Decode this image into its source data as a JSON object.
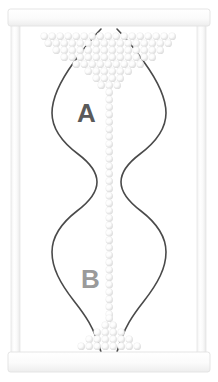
{
  "figure": {
    "background_color": "#ffffff"
  },
  "frame": {
    "top_bar": {
      "name": "top-rail-bar",
      "x": 8,
      "y": 9,
      "width": 202,
      "height": 17,
      "fill": "#fbfbfb",
      "stroke": "#e2e2e2"
    },
    "bottom_bar": {
      "name": "bottom-rail-bar",
      "x": 8,
      "y": 352,
      "width": 202,
      "height": 20,
      "fill": "#fbfbfb",
      "stroke": "#e2e2e2"
    },
    "left_rail": {
      "name": "left-vertical-rail",
      "x": 11,
      "y": 25,
      "width": 9,
      "height": 329,
      "fill": "#fcfcfc",
      "stroke": "#e6e6e6"
    },
    "right_rail": {
      "name": "right-vertical-rail",
      "x": 197,
      "y": 25,
      "width": 9,
      "height": 329,
      "fill": "#fcfcfc",
      "stroke": "#e6e6e6"
    }
  },
  "chamber_outline": {
    "stroke_color": "#4a4a4a",
    "stroke_width": 1.6,
    "fill": "#ffffff",
    "left_wall_path": "M 101,29 C 92,38 84,48 74,62 C 58,84 52,100 52,113 C 52,132 66,145 78,154 C 90,163 97,172 97,182 C 97,193 89,202 77,211 C 64,221 52,234 52,252 C 52,268 60,283 74,301 C 85,315 94,327 101,352",
    "right_wall_path": "M 117,29 C 126,38 134,48 144,62 C 160,84 166,100 166,113 C 166,132 152,145 140,154 C 128,163 121,172 121,182 C 121,193 129,202 141,211 C 154,221 166,234 166,252 C 166,268 158,283 144,301 C 133,315 124,327 117,352"
  },
  "labels": [
    {
      "name": "chamber-label-a",
      "text": "A",
      "x": 77,
      "y": 122,
      "font_size": 26,
      "color": "#5a5a5a"
    },
    {
      "name": "chamber-label-b",
      "text": "B",
      "x": 81,
      "y": 288,
      "font_size": 26,
      "color": "#9a9a9a"
    }
  ],
  "beads": {
    "fill": "#fdfdfd",
    "shadow_color": "#d0d0d0",
    "outline_color": "#e8e8e8",
    "radius": 3.4,
    "top_reservoir": {
      "name": "top-bead-reservoir",
      "description": "Triangular funnel-shaped pile of beads narrowing downward",
      "rows": [
        {
          "y": 36,
          "xs": [
            44,
            52,
            60,
            68,
            76,
            84,
            92,
            100,
            108,
            116,
            124,
            132,
            140,
            148,
            156,
            164,
            172
          ]
        },
        {
          "y": 43,
          "xs": [
            48,
            56,
            64,
            72,
            80,
            88,
            96,
            104,
            112,
            120,
            128,
            136,
            144,
            152,
            160,
            168
          ]
        },
        {
          "y": 50,
          "xs": [
            56,
            64,
            72,
            80,
            88,
            96,
            104,
            112,
            120,
            128,
            136,
            144,
            152,
            160
          ]
        },
        {
          "y": 57,
          "xs": [
            64,
            72,
            80,
            88,
            96,
            104,
            112,
            120,
            128,
            136,
            144,
            152
          ]
        },
        {
          "y": 64,
          "xs": [
            76,
            84,
            92,
            100,
            108,
            116,
            124,
            132,
            140
          ]
        },
        {
          "y": 71,
          "xs": [
            88,
            96,
            104,
            112,
            120,
            128
          ]
        },
        {
          "y": 78,
          "xs": [
            96,
            104,
            112,
            120
          ]
        },
        {
          "y": 85,
          "xs": [
            101,
            109,
            117
          ]
        }
      ]
    },
    "central_stream": {
      "name": "central-bead-stream",
      "description": "Single vertical column of beads falling through the narrow waist",
      "x": 109,
      "y_start": 92,
      "y_end": 314,
      "spacing": 7.4
    },
    "bottom_pile": {
      "name": "bottom-bead-pile",
      "description": "Small conical pile of beads accumulating at the base",
      "rows": [
        {
          "y": 318,
          "xs": [
            109
          ]
        },
        {
          "y": 325,
          "xs": [
            105,
            113
          ]
        },
        {
          "y": 332,
          "xs": [
            97,
            105,
            113,
            121
          ]
        },
        {
          "y": 339,
          "xs": [
            89,
            97,
            105,
            113,
            121,
            129
          ]
        },
        {
          "y": 346,
          "xs": [
            81,
            89,
            97,
            105,
            113,
            121,
            129,
            137
          ]
        }
      ]
    }
  }
}
